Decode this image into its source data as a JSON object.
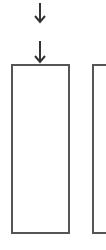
{
  "diagram": {
    "colors": {
      "stroke": "#555555",
      "arrow": "#333333",
      "background": "#ffffff"
    },
    "arrows": [
      {
        "id": "arrow-1",
        "icon": "arrow-down-icon",
        "x": 40,
        "y_start": 4,
        "y_end": 22
      },
      {
        "id": "arrow-2",
        "icon": "arrow-down-icon",
        "x": 40,
        "y_start": 42,
        "y_end": 63
      }
    ],
    "boxes": [
      {
        "id": "box-1",
        "label": "",
        "x": 11,
        "y": 64,
        "width": 59,
        "height": 170
      },
      {
        "id": "box-2",
        "label": "",
        "x": 92,
        "y": 64,
        "width": 20,
        "height": 170,
        "clipped": true
      }
    ]
  }
}
